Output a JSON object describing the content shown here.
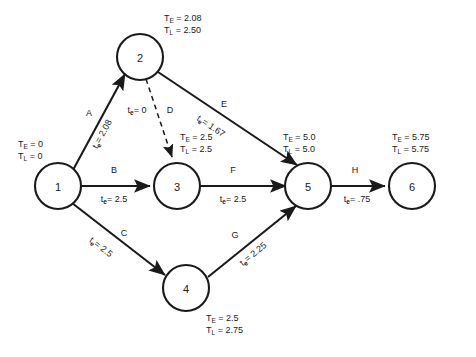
{
  "diagram": {
    "type": "pert-network",
    "title": "",
    "node_label_prefix_early": "T",
    "node_label_prefix_late": "T",
    "early_subscript": "E",
    "late_subscript": "L",
    "duration_symbol": "t",
    "duration_subscript": "e",
    "equals": "=",
    "stroke_color": "#1a1a1a",
    "background_color": "#ffffff"
  },
  "nodes": [
    {
      "id": "1",
      "label": "1",
      "te": "0",
      "tl": "0",
      "te_text": "T  = 0",
      "tl_text": "T  = 0"
    },
    {
      "id": "2",
      "label": "2",
      "te": "2.08",
      "tl": "2.50",
      "te_text": "T  = 2.08",
      "tl_text": "T  = 2.50"
    },
    {
      "id": "3",
      "label": "3",
      "te": "2.5",
      "tl": "2.5",
      "te_text": "T  = 2.5",
      "tl_text": "T  = 2.5"
    },
    {
      "id": "4",
      "label": "4",
      "te": "2.5",
      "tl": "2.75",
      "te_text": "T  = 2.5",
      "tl_text": "T  = 2.75"
    },
    {
      "id": "5",
      "label": "5",
      "te": "5.0",
      "tl": "5.0",
      "te_text": "T  = 5.0",
      "tl_text": "T  = 5.0"
    },
    {
      "id": "6",
      "label": "6",
      "te": "5.75",
      "tl": "5.75",
      "te_text": "T  = 5.75",
      "tl_text": "T  = 5.75"
    }
  ],
  "edges": [
    {
      "id": "A",
      "name": "A",
      "from": "1",
      "to": "2",
      "duration": "2.08",
      "duration_text": "= 2.08",
      "dummy": false
    },
    {
      "id": "B",
      "name": "B",
      "from": "1",
      "to": "3",
      "duration": "2.5",
      "duration_text": "= 2.5",
      "dummy": false
    },
    {
      "id": "C",
      "name": "C",
      "from": "1",
      "to": "4",
      "duration": "2.5",
      "duration_text": "= 2.5",
      "dummy": false
    },
    {
      "id": "D",
      "name": "D",
      "from": "2",
      "to": "3",
      "duration": "0",
      "duration_text": "= 0",
      "dummy": true
    },
    {
      "id": "E",
      "name": "E",
      "from": "2",
      "to": "5",
      "duration": "1.67",
      "duration_text": "= 1.67",
      "dummy": false
    },
    {
      "id": "F",
      "name": "F",
      "from": "3",
      "to": "5",
      "duration": "2.5",
      "duration_text": "= 2.5",
      "dummy": false
    },
    {
      "id": "G",
      "name": "G",
      "from": "4",
      "to": "5",
      "duration": "2.25",
      "duration_text": "= 2.25",
      "dummy": false
    },
    {
      "id": "H",
      "name": "H",
      "from": "5",
      "to": "6",
      "duration": ".75",
      "duration_text": "= .75",
      "dummy": false
    }
  ]
}
